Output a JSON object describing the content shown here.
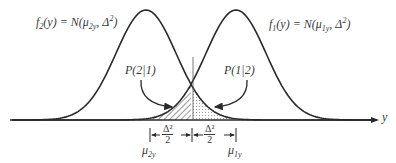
{
  "diagram": {
    "type": "two-normal-densities-misclassification",
    "curves": [
      {
        "name": "f2",
        "label_func": "f",
        "label_sub": "2",
        "label_arg": "(y) = N(μ",
        "mean_sub": "2y",
        "label_var": ", Δ",
        "var_sup": "2",
        "label_close": ")",
        "mean_x": 146
      },
      {
        "name": "f1",
        "label_func": "f",
        "label_sub": "1",
        "label_arg": "(y) = N(μ",
        "mean_sub": "1y",
        "label_var": ", Δ",
        "var_sup": "2",
        "label_close": ")",
        "mean_x": 236
      }
    ],
    "regions": {
      "left_label": "P(2|1)",
      "right_label": "P(1|2)",
      "left_fill": "hatched",
      "right_fill": "dotted"
    },
    "axis": {
      "label": "y"
    },
    "markers": {
      "mu2": {
        "sym": "μ",
        "sub": "2y"
      },
      "mu1": {
        "sym": "μ",
        "sub": "1y"
      },
      "half_distance": {
        "num": "Δ²",
        "den": "2"
      }
    },
    "colors": {
      "line": "#2a2a2a",
      "text": "#3a3a3a",
      "background": "#ffffff"
    }
  }
}
